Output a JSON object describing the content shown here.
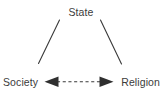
{
  "diagram": {
    "type": "triangle-relationship-diagram",
    "background_color": "#ffffff",
    "text_color": "#3b3b3b",
    "line_color": "#3a3a3a",
    "nodes": [
      {
        "id": "state",
        "label": "State",
        "position": "top-center"
      },
      {
        "id": "society",
        "label": "Society",
        "position": "bottom-left"
      },
      {
        "id": "religion",
        "label": "Religion",
        "position": "bottom-right"
      }
    ],
    "edges": [
      {
        "id": "state-society",
        "from": "State",
        "to": "Society",
        "style": "solid",
        "arrowheads": "none"
      },
      {
        "id": "state-religion",
        "from": "State",
        "to": "Religion",
        "style": "solid",
        "arrowheads": "none"
      },
      {
        "id": "society-religion",
        "from": "Society",
        "to": "Religion",
        "style": "dashed",
        "arrowheads": "both"
      }
    ]
  }
}
